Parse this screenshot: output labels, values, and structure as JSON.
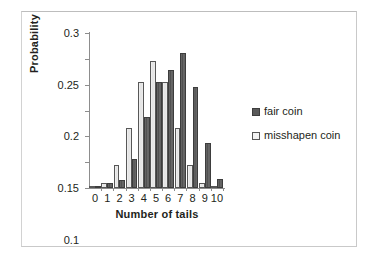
{
  "chart_data": {
    "type": "bar",
    "title": "",
    "subtitle": "",
    "xlabel": "Number of tails",
    "ylabel": "Probability",
    "categories": [
      "0",
      "1",
      "2",
      "3",
      "4",
      "5",
      "6",
      "7",
      "8",
      "9",
      "10"
    ],
    "series": [
      {
        "name": "fair coin",
        "color": "#5a5a5a",
        "values": [
          0.001,
          0.01,
          0.016,
          0.057,
          0.138,
          0.205,
          0.228,
          0.261,
          0.196,
          0.087,
          0.018
        ]
      },
      {
        "name": "misshapen coin",
        "color": "#ededed",
        "values": [
          0.001,
          0.009,
          0.044,
          0.117,
          0.205,
          0.246,
          0.205,
          0.117,
          0.045,
          0.009,
          0.001
        ]
      }
    ],
    "ylim": [
      0,
      0.3
    ],
    "ytick_labels": [
      "0",
      "0.05",
      "0.1",
      "0.15",
      "0.2",
      "0.25",
      "0.3"
    ],
    "ytick_values": [
      0,
      0.05,
      0.1,
      0.15,
      0.2,
      0.25,
      0.3
    ],
    "xtick_labels": [
      "0",
      "1",
      "2",
      "3",
      "4",
      "5",
      "6",
      "7",
      "8",
      "9",
      "10"
    ],
    "grid": false,
    "legend_position": "right",
    "legend": [
      {
        "label": "fair coin",
        "swatch": "dark-gray-square"
      },
      {
        "label": "misshapen coin",
        "swatch": "light-gray-square"
      }
    ]
  },
  "colors": {
    "fair_bar": "#5a5a5a",
    "misshapen_bar": "#ededed",
    "bar_outline": "#3d3d3d",
    "axis": "#8d8d8d",
    "text": "#231f20",
    "frame": "#c9c9c9",
    "background": "#ffffff"
  }
}
